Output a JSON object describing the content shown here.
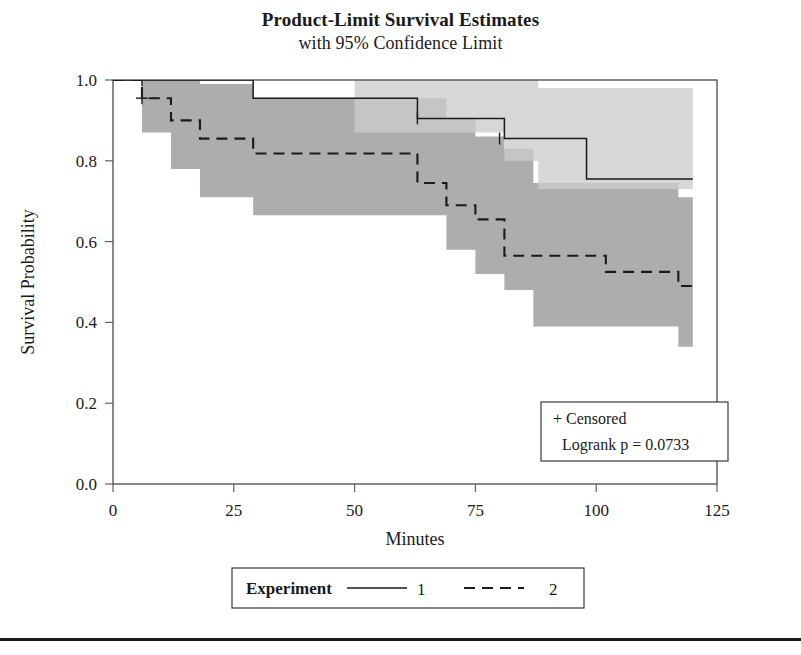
{
  "figure": {
    "title": "Product-Limit Survival Estimates",
    "subtitle": "with 95% Confidence Limit"
  },
  "annotation": {
    "censored_label": "+ Censored",
    "logrank_label": "Logrank p = 0.0733"
  },
  "legend": {
    "title": "Experiment",
    "entries": [
      {
        "label": "1",
        "style": "solid"
      },
      {
        "label": "2",
        "style": "dashed"
      }
    ]
  },
  "colors": {
    "line": "#1a1a1a",
    "band_light": "#cccccc",
    "band_dark": "#a9a9a9",
    "frame": "#3a3a3a",
    "background": "#ffffff"
  },
  "chart_data": {
    "type": "line",
    "title": "Product-Limit Survival Estimates",
    "subtitle": "with 95% Confidence Limit",
    "xlabel": "Minutes",
    "ylabel": "Survival Probability",
    "xlim": [
      0,
      125
    ],
    "ylim": [
      0.0,
      1.0
    ],
    "xticks": [
      0,
      25,
      50,
      75,
      100,
      125
    ],
    "xtick_labels": [
      "0",
      "25",
      "50",
      "75",
      "100",
      "125"
    ],
    "yticks": [
      0.0,
      0.2,
      0.4,
      0.6,
      0.8,
      1.0
    ],
    "ytick_labels": [
      "0.0",
      "0.2",
      "0.4",
      "0.6",
      "0.8",
      "1.0"
    ],
    "grid": false,
    "legend_position": "below-axes",
    "step_type": "post",
    "series": [
      {
        "name": "1",
        "style": "solid",
        "x": [
          0,
          29,
          50,
          63,
          81,
          88,
          98,
          120
        ],
        "values": [
          1.0,
          1.0,
          0.955,
          0.955,
          0.905,
          0.855,
          0.855,
          0.755
        ],
        "step_x": [
          0,
          29,
          29,
          50,
          50,
          63,
          63,
          81,
          81,
          88,
          88,
          98,
          98,
          120
        ],
        "step_y": [
          1.0,
          1.0,
          0.955,
          0.955,
          0.955,
          0.955,
          0.905,
          0.905,
          0.855,
          0.855,
          0.855,
          0.855,
          0.755,
          0.755
        ],
        "censored_x": [
          6,
          63,
          80
        ],
        "censored_y": [
          1.0,
          0.905,
          0.855
        ],
        "ci_lower": [
          1.0,
          1.0,
          0.87,
          0.87,
          0.8,
          0.73,
          0.73,
          0.62
        ],
        "ci_upper": [
          1.0,
          1.0,
          1.0,
          1.0,
          1.0,
          0.98,
          0.98,
          0.89
        ]
      },
      {
        "name": "2",
        "style": "dashed",
        "x": [
          0,
          6,
          12,
          18,
          29,
          38,
          50,
          63,
          69,
          75,
          81,
          87,
          102,
          117,
          120
        ],
        "values": [
          1.0,
          0.955,
          0.9,
          0.855,
          0.818,
          0.818,
          0.818,
          0.818,
          0.745,
          0.69,
          0.655,
          0.565,
          0.565,
          0.525,
          0.49
        ],
        "step_x": [
          0,
          6,
          6,
          12,
          12,
          18,
          18,
          29,
          29,
          50,
          50,
          63,
          63,
          69,
          69,
          75,
          75,
          81,
          81,
          87,
          87,
          102,
          102,
          117,
          117,
          120
        ],
        "step_y": [
          1.0,
          1.0,
          0.955,
          0.955,
          0.9,
          0.9,
          0.855,
          0.855,
          0.818,
          0.818,
          0.818,
          0.818,
          0.745,
          0.745,
          0.69,
          0.69,
          0.655,
          0.655,
          0.565,
          0.565,
          0.565,
          0.565,
          0.525,
          0.525,
          0.49,
          0.49
        ],
        "censored_x": [
          6
        ],
        "censored_y": [
          0.955
        ],
        "ci_lower": [
          1.0,
          0.87,
          0.78,
          0.71,
          0.665,
          0.665,
          0.665,
          0.665,
          0.58,
          0.52,
          0.48,
          0.39,
          0.39,
          0.34,
          0.3
        ],
        "ci_upper": [
          1.0,
          1.0,
          1.0,
          0.99,
          0.955,
          0.955,
          0.955,
          0.955,
          0.905,
          0.86,
          0.83,
          0.745,
          0.745,
          0.71,
          0.68
        ]
      }
    ],
    "statistics": {
      "logrank_p": 0.0733
    }
  }
}
